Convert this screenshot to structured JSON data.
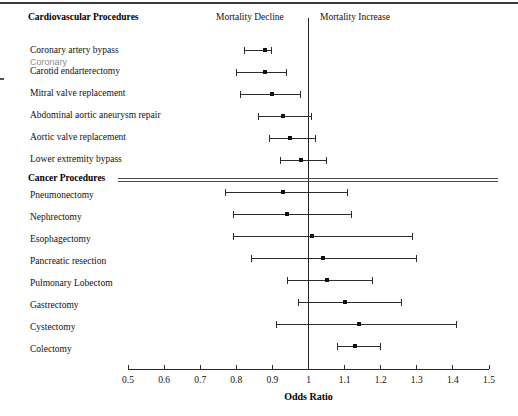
{
  "figure": {
    "width": 518,
    "height": 416
  },
  "annotations": {
    "mortality_decline": "Mortality Decline",
    "mortality_increase": "Mortality Increase"
  },
  "sections": {
    "cardiovascular": "Cardiovascular Procedures",
    "cancer": "Cancer Procedures"
  },
  "overlay": {
    "ghost_text": "Coronary"
  },
  "chart_data": {
    "type": "forest",
    "title": "",
    "xlabel": "Odds Ratio",
    "ylabel": "",
    "xlim": [
      0.5,
      1.5
    ],
    "xticks": [
      0.5,
      0.6,
      0.7,
      0.8,
      0.9,
      1.0,
      1.1,
      1.2,
      1.3,
      1.4,
      1.5
    ],
    "xtick_labels": [
      "0.5",
      "0.6",
      "0.7",
      "0.8",
      "0.9",
      "1",
      "1.1",
      "1.2",
      "1.3",
      "1.4",
      "1.5"
    ],
    "reference_line": 1.0,
    "grid": false,
    "legend": "none",
    "groups": [
      {
        "name": "Cardiovascular Procedures",
        "rows": [
          {
            "label": "Coronary artery bypass",
            "estimate": 0.88,
            "ci_low": 0.82,
            "ci_high": 0.9
          },
          {
            "label": "Carotid endarterectomy",
            "estimate": 0.88,
            "ci_low": 0.8,
            "ci_high": 0.94
          },
          {
            "label": "Mitral valve replacement",
            "estimate": 0.9,
            "ci_low": 0.81,
            "ci_high": 0.98
          },
          {
            "label": "Abdominal aortic aneurysm repair",
            "estimate": 0.93,
            "ci_low": 0.86,
            "ci_high": 1.01
          },
          {
            "label": "Aortic valve replacement",
            "estimate": 0.95,
            "ci_low": 0.89,
            "ci_high": 1.02
          },
          {
            "label": "Lower extremity bypass",
            "estimate": 0.98,
            "ci_low": 0.92,
            "ci_high": 1.05
          }
        ]
      },
      {
        "name": "Cancer Procedures",
        "rows": [
          {
            "label": "Pneumonectomy",
            "estimate": 0.93,
            "ci_low": 0.77,
            "ci_high": 1.11
          },
          {
            "label": "Nephrectomy",
            "estimate": 0.94,
            "ci_low": 0.79,
            "ci_high": 1.12
          },
          {
            "label": "Esophagectomy",
            "estimate": 1.01,
            "ci_low": 0.79,
            "ci_high": 1.29
          },
          {
            "label": "Pancreatic resection",
            "estimate": 1.04,
            "ci_low": 0.84,
            "ci_high": 1.3
          },
          {
            "label": "Pulmonary Lobectom",
            "estimate": 1.05,
            "ci_low": 0.94,
            "ci_high": 1.18
          },
          {
            "label": "Gastrectomy",
            "estimate": 1.1,
            "ci_low": 0.97,
            "ci_high": 1.26
          },
          {
            "label": "Cystectomy",
            "estimate": 1.14,
            "ci_low": 0.91,
            "ci_high": 1.41
          },
          {
            "label": "Colectomy",
            "estimate": 1.13,
            "ci_low": 1.08,
            "ci_high": 1.2
          }
        ]
      }
    ]
  }
}
